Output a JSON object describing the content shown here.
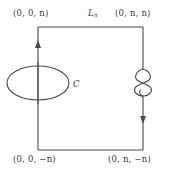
{
  "figure": {
    "type": "mathematical-diagram",
    "background_color": "#ffffff",
    "stroke_color": "#4a4a4a",
    "labels": {
      "top_left_vertex": "(0, 0, n)",
      "top_right_vertex": "(0, n, n)",
      "bottom_left_vertex": "(0, 0, −n)",
      "bottom_right_vertex": "(0, n, −n)",
      "loop_name": "L",
      "loop_subscript": "n",
      "curve_name": "C"
    },
    "geometry": {
      "rectangle": {
        "left": 38,
        "right": 143,
        "top": 27,
        "bottom": 150
      },
      "left_edge_arrow_direction": "up",
      "right_edge_arrow_direction": "down",
      "ellipse": {
        "center_x": 38,
        "center_y": 83,
        "radius_x": 31,
        "radius_y": 17
      },
      "knot": {
        "center_x": 143,
        "center_y": 83,
        "style": "overhand-knot"
      }
    }
  }
}
